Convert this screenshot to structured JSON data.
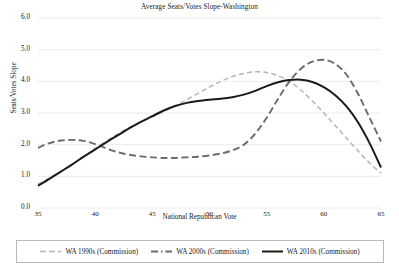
{
  "chart_data": {
    "type": "line",
    "title": "Average Seats/Votes Slope-Washington",
    "xlabel": "National Republican Vote",
    "ylabel": "Seats/Votes Slope",
    "xlim": [
      35,
      65
    ],
    "ylim": [
      0.0,
      6.0
    ],
    "xticks": [
      "35",
      "40",
      "45",
      "50",
      "55",
      "60",
      "65"
    ],
    "yticks": [
      "0.0",
      "1.0",
      "2.0",
      "3.0",
      "4.0",
      "5.0",
      "6.0"
    ],
    "grid": "horizontal",
    "legend_position": "bottom",
    "x": [
      35,
      36,
      37,
      38,
      39,
      40,
      41,
      42,
      43,
      44,
      45,
      46,
      47,
      48,
      49,
      50,
      51,
      52,
      53,
      54,
      55,
      56,
      57,
      58,
      59,
      60,
      61,
      62,
      63,
      64,
      65
    ],
    "series": [
      {
        "name": "WA 1990s (Commission)",
        "color": "#b6b6b6",
        "style": "dashed",
        "values": [
          0.75,
          0.95,
          1.15,
          1.38,
          1.62,
          1.88,
          2.12,
          2.35,
          2.55,
          2.72,
          2.88,
          3.05,
          3.22,
          3.42,
          3.62,
          3.82,
          4.0,
          4.15,
          4.25,
          4.3,
          4.28,
          4.18,
          4.0,
          3.72,
          3.38,
          3.0,
          2.6,
          2.2,
          1.8,
          1.42,
          1.1
        ]
      },
      {
        "name": "WA 2000s (Commission)",
        "color": "#6b6b6b",
        "style": "dash-dot",
        "values": [
          1.9,
          2.05,
          2.13,
          2.15,
          2.12,
          2.02,
          1.88,
          1.76,
          1.68,
          1.63,
          1.6,
          1.58,
          1.58,
          1.6,
          1.62,
          1.66,
          1.72,
          1.82,
          2.0,
          2.35,
          2.85,
          3.45,
          4.0,
          4.4,
          4.62,
          4.68,
          4.55,
          4.2,
          3.6,
          2.85,
          2.1
        ]
      },
      {
        "name": "WA 2010s (Commission)",
        "color": "#1a1a1a",
        "style": "solid",
        "values": [
          0.7,
          0.92,
          1.15,
          1.38,
          1.62,
          1.85,
          2.08,
          2.3,
          2.52,
          2.72,
          2.9,
          3.08,
          3.22,
          3.32,
          3.38,
          3.42,
          3.45,
          3.5,
          3.58,
          3.7,
          3.85,
          3.97,
          4.04,
          4.05,
          3.98,
          3.82,
          3.56,
          3.2,
          2.7,
          2.05,
          1.28
        ]
      }
    ]
  }
}
